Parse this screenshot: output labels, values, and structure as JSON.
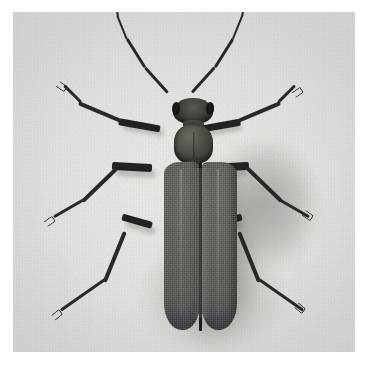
{
  "image": {
    "kind": "photograph",
    "subject": "longhorn beetle (Cerambycidae), dorsal view",
    "medium": "black and white halftone print",
    "alt_text": "Black-and-white overhead photograph of a longhorn beetle with long curved antennae, a barrel-shaped pronotum and two elongated grey elytra, resting on a pale grainy background with soft shadows.",
    "plate": {
      "left": 13,
      "top": 12,
      "width": 342,
      "height": 340
    },
    "caption": ""
  },
  "palette": {
    "page_background": "#ffffff",
    "plate_background": "#e7e5e1",
    "plate_background_edge": "#dedcd8",
    "body_mid_grey": "#6a6862",
    "body_dark": "#3c3a35",
    "limb_black": "#2a2926",
    "suture_black": "#1a1917",
    "shadow_grey": "#5a584f"
  },
  "anatomy": {
    "head": {
      "label": "head",
      "left": 160,
      "top": 86,
      "width": 40,
      "height": 26
    },
    "eyes": [
      {
        "label": "left compound eye",
        "side": "left"
      },
      {
        "label": "right compound eye",
        "side": "right"
      }
    ],
    "neck": {
      "label": "neck",
      "left": 170,
      "top": 108,
      "width": 21,
      "height": 8
    },
    "pronotum": {
      "label": "pronotum",
      "left": 161,
      "top": 113,
      "width": 39,
      "height": 38
    },
    "scutellum": {
      "label": "scutellum",
      "left": 174,
      "top": 148,
      "width": 13,
      "height": 9
    },
    "elytra": [
      {
        "label": "left elytron",
        "left": 151,
        "top": 150,
        "width": 36,
        "height": 168
      },
      {
        "label": "right elytron",
        "left": 188,
        "top": 150,
        "width": 36,
        "height": 168
      }
    ],
    "suture": {
      "label": "elytral suture",
      "left": 186,
      "top": 150,
      "width": 3,
      "height": 169
    },
    "antennae": [
      {
        "label": "left antenna",
        "side": "left",
        "segments": [
          {
            "x": 168,
            "y": 92,
            "len": 34,
            "angle": -132,
            "w": 3.4
          },
          {
            "x": 145,
            "y": 67,
            "len": 34,
            "angle": -122,
            "w": 3.0
          },
          {
            "x": 127,
            "y": 39,
            "len": 24,
            "angle": -112,
            "w": 2.4
          },
          {
            "x": 118,
            "y": 17,
            "len": 12,
            "angle": -100,
            "w": 1.8
          }
        ]
      },
      {
        "label": "right antenna",
        "side": "right",
        "segments": [
          {
            "x": 192,
            "y": 92,
            "len": 34,
            "angle": -48,
            "w": 3.4
          },
          {
            "x": 215,
            "y": 67,
            "len": 34,
            "angle": -58,
            "w": 3.0
          },
          {
            "x": 233,
            "y": 39,
            "len": 24,
            "angle": -68,
            "w": 2.4
          },
          {
            "x": 242,
            "y": 17,
            "len": 12,
            "angle": -80,
            "w": 1.8
          }
        ]
      }
    ],
    "legs": [
      {
        "label": "left foreleg",
        "side": "left",
        "position": "fore",
        "segments": [
          {
            "name": "femur",
            "x": 160,
            "y": 126,
            "len": 40,
            "angle": 190,
            "w": 6.5
          },
          {
            "name": "tibia",
            "x": 121,
            "y": 119,
            "len": 44,
            "angle": 203,
            "w": 4.0
          },
          {
            "name": "tarsus",
            "x": 81,
            "y": 101,
            "len": 22,
            "angle": 225,
            "w": 2.8
          }
        ],
        "claw": {
          "x": 66,
          "y": 86,
          "angle": 225
        }
      },
      {
        "label": "right foreleg",
        "side": "right",
        "position": "fore",
        "segments": [
          {
            "name": "femur",
            "x": 200,
            "y": 126,
            "len": 40,
            "angle": -10,
            "w": 6.5
          },
          {
            "name": "tibia",
            "x": 239,
            "y": 119,
            "len": 44,
            "angle": -23,
            "w": 4.0
          },
          {
            "name": "tarsus",
            "x": 279,
            "y": 101,
            "len": 22,
            "angle": -45,
            "w": 2.8
          }
        ],
        "claw": {
          "x": 294,
          "y": 86,
          "angle": -45
        }
      },
      {
        "label": "left midleg",
        "side": "left",
        "position": "mid",
        "segments": [
          {
            "name": "femur",
            "x": 152,
            "y": 164,
            "len": 36,
            "angle": 183,
            "w": 8.0
          },
          {
            "name": "tibia",
            "x": 117,
            "y": 166,
            "len": 46,
            "angle": 136,
            "w": 4.2
          },
          {
            "name": "tarsus",
            "x": 84,
            "y": 198,
            "len": 33,
            "angle": 150,
            "w": 3.0
          }
        ],
        "claw": {
          "x": 55,
          "y": 215,
          "angle": 150
        }
      },
      {
        "label": "right midleg",
        "side": "right",
        "position": "mid",
        "segments": [
          {
            "name": "femur",
            "x": 224,
            "y": 164,
            "len": 36,
            "angle": -3,
            "w": 8.0
          },
          {
            "name": "tibia",
            "x": 259,
            "y": 166,
            "len": 46,
            "angle": 44,
            "w": 4.2
          },
          {
            "name": "tarsus",
            "x": 292,
            "y": 198,
            "len": 33,
            "angle": 30,
            "w": 3.0
          }
        ],
        "claw": {
          "x": 321,
          "y": 215,
          "angle": 30
        }
      },
      {
        "label": "left hindleg",
        "side": "left",
        "position": "hind",
        "segments": [
          {
            "name": "femur",
            "x": 152,
            "y": 222,
            "len": 28,
            "angle": 196,
            "w": 7.0
          },
          {
            "name": "tibia",
            "x": 125,
            "y": 230,
            "len": 52,
            "angle": 112,
            "w": 3.8
          },
          {
            "name": "tarsus",
            "x": 105,
            "y": 278,
            "len": 52,
            "angle": 145,
            "w": 2.8
          }
        ],
        "claw": {
          "x": 62,
          "y": 308,
          "angle": 145
        }
      },
      {
        "label": "right hindleg",
        "side": "right",
        "position": "hind",
        "segments": [
          {
            "name": "femur",
            "x": 224,
            "y": 222,
            "len": 28,
            "angle": -16,
            "w": 7.0
          },
          {
            "name": "tibia",
            "x": 251,
            "y": 230,
            "len": 52,
            "angle": 68,
            "w": 3.8
          },
          {
            "name": "tarsus",
            "x": 271,
            "y": 278,
            "len": 52,
            "angle": 35,
            "w": 2.8
          }
        ],
        "claw": {
          "x": 314,
          "y": 308,
          "angle": 35
        }
      }
    ]
  }
}
